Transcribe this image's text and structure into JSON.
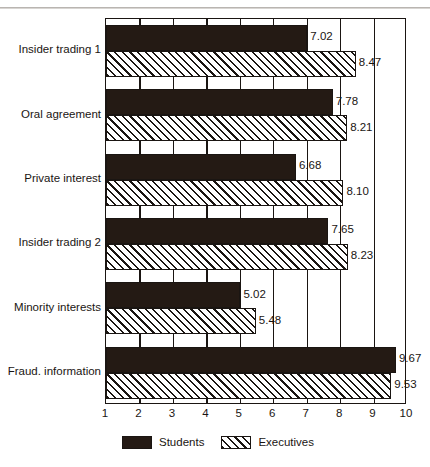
{
  "chart_data": {
    "type": "bar",
    "orientation": "horizontal",
    "title": "",
    "subtitle": "",
    "xlabel": "",
    "ylabel": "",
    "xlim": [
      1,
      10
    ],
    "xticks": [
      "1",
      "2",
      "3",
      "4",
      "5",
      "6",
      "7",
      "8",
      "9",
      "10"
    ],
    "grid": true,
    "grid_axis": "x",
    "legend_position": "bottom",
    "categories": [
      "Insider trading 1",
      "Oral agreement",
      "Private interest",
      "Insider trading 2",
      "Minority interests",
      "Fraud. information"
    ],
    "series": [
      {
        "name": "Students",
        "color": "#241a14",
        "fill": "solid",
        "values": [
          7.02,
          7.78,
          6.68,
          7.65,
          5.02,
          9.67
        ],
        "labels": [
          "7.02",
          "7.78",
          "6.68",
          "7.65",
          "5.02",
          "9.67"
        ]
      },
      {
        "name": "Executives",
        "color": "#1a1512",
        "fill": "diagonal-hatch",
        "values": [
          8.47,
          8.21,
          8.1,
          8.23,
          5.48,
          9.53
        ],
        "labels": [
          "8.47",
          "8.21",
          "8.10",
          "8.23",
          "5.48",
          "9.53"
        ]
      }
    ]
  },
  "legend": {
    "items": [
      {
        "label": "Students",
        "swatch": "solid-black-swatch"
      },
      {
        "label": "Executives",
        "swatch": "hatched-swatch"
      }
    ]
  }
}
